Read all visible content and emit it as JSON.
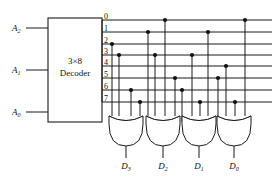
{
  "diagram": {
    "colors": {
      "ink": "#111111",
      "background": "#ffffff"
    },
    "decoder": {
      "label_line1": "3×8",
      "label_line2": "Decoder",
      "box": {
        "x": 48,
        "y": 18,
        "w": 54,
        "h": 104
      }
    },
    "inputs": [
      {
        "name": "A2",
        "base": "A",
        "sub": "2",
        "y": 28
      },
      {
        "name": "A1",
        "base": "A",
        "sub": "1",
        "y": 70
      },
      {
        "name": "A0",
        "base": "A",
        "sub": "0",
        "y": 112
      }
    ],
    "outputs": [
      {
        "label": "0",
        "y": 20
      },
      {
        "label": "1",
        "y": 32
      },
      {
        "label": "2",
        "y": 44
      },
      {
        "label": "3",
        "y": 55
      },
      {
        "label": "4",
        "y": 66
      },
      {
        "label": "5",
        "y": 78
      },
      {
        "label": "6",
        "y": 90
      },
      {
        "label": "7",
        "y": 102
      }
    ],
    "bus": {
      "x_start": 102,
      "x_end": 272
    },
    "gates": [
      {
        "name": "D3",
        "base": "D",
        "sub": "3",
        "cx": 126,
        "wires": [
          {
            "x": 112,
            "line": 2
          },
          {
            "x": 119,
            "line": 3
          },
          {
            "x": 131,
            "line": 6
          },
          {
            "x": 140,
            "line": 7
          }
        ]
      },
      {
        "name": "D2",
        "base": "D",
        "sub": "2",
        "cx": 163,
        "wires": [
          {
            "x": 148,
            "line": 1
          },
          {
            "x": 155,
            "line": 3
          },
          {
            "x": 165,
            "line": 0
          },
          {
            "x": 175,
            "line": 5
          }
        ]
      },
      {
        "name": "D1",
        "base": "D",
        "sub": "1",
        "cx": 199,
        "wires": [
          {
            "x": 182,
            "line": 6
          },
          {
            "x": 192,
            "line": 3
          },
          {
            "x": 200,
            "line": 7
          },
          {
            "x": 208,
            "line": 1
          }
        ]
      },
      {
        "name": "D0",
        "base": "D",
        "sub": "0",
        "cx": 234,
        "wires": [
          {
            "x": 218,
            "line": 5
          },
          {
            "x": 226,
            "line": 4
          },
          {
            "x": 235,
            "line": 7
          },
          {
            "x": 245,
            "line": 0
          }
        ]
      }
    ],
    "gate_geometry": {
      "top_y": 116,
      "bottom_y": 146,
      "half_width": 17,
      "out_len": 12
    },
    "dot_radius": 2.1
  }
}
